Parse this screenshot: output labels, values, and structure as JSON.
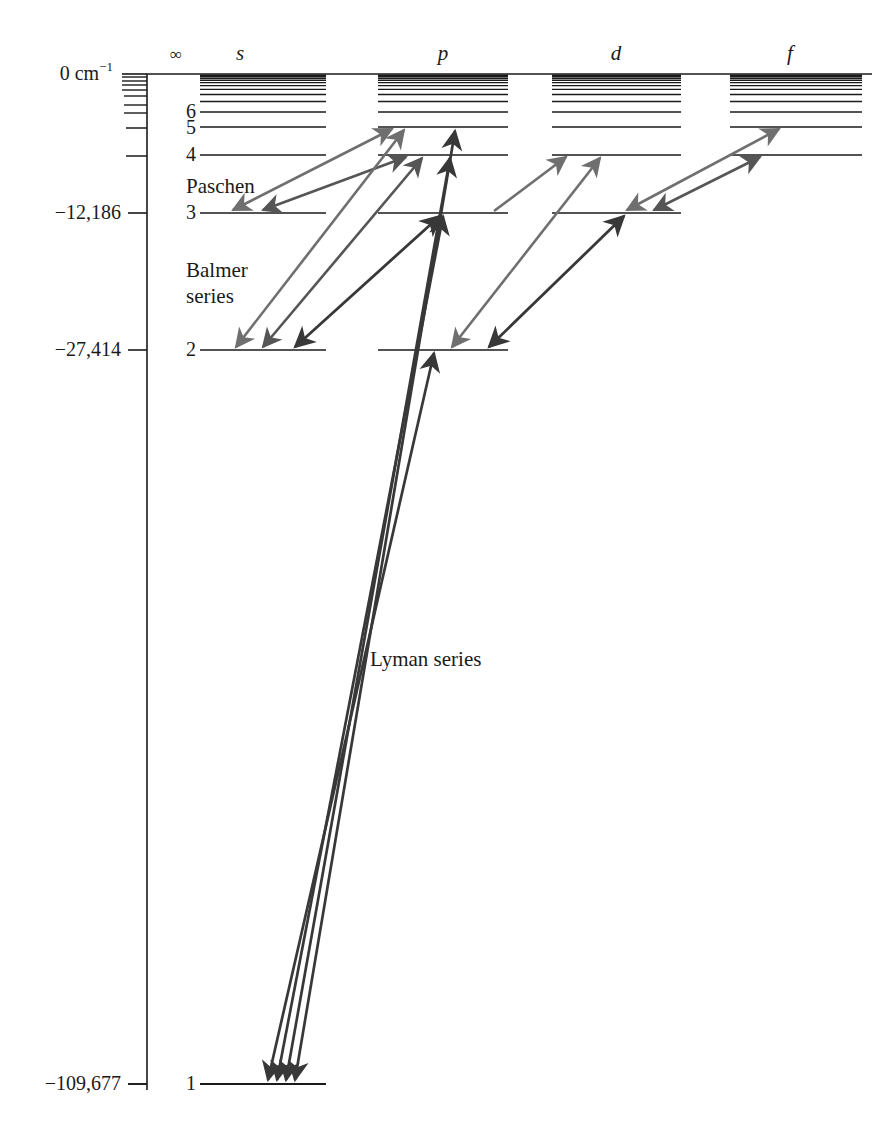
{
  "figure": {
    "kind": "grotrian-energy-level-diagram",
    "background_color": "#ffffff",
    "ink_color": "#1a1a1a"
  },
  "axis": {
    "unit_label_top": "0 cm",
    "unit_label_top_sup": "−1",
    "ticks": [
      {
        "label": "0 cm−1",
        "value": 0,
        "y": 74
      },
      {
        "label": "",
        "value": -12186,
        "y": 213
      },
      {
        "label": "−12,186",
        "value": -12186,
        "y": 213
      },
      {
        "label": "−27,414",
        "value": -27414,
        "y": 350
      },
      {
        "label": "−109,677",
        "value": -109677,
        "y": 1084
      }
    ],
    "labeled_ticks": [
      {
        "text": "0 cm",
        "sup": "−1",
        "y": 74
      },
      {
        "text": "−12,186",
        "sup": "",
        "y": 213
      },
      {
        "text": "−27,414",
        "sup": "",
        "y": 350
      },
      {
        "text": "−109,677",
        "sup": "",
        "y": 1084
      }
    ],
    "minor_tick_ys": [
      77,
      82,
      87,
      92,
      98,
      106,
      113,
      127,
      155
    ]
  },
  "columns": [
    {
      "name": "infinity",
      "label": "∞",
      "header_x": 176,
      "x1": 0,
      "x2": 0,
      "italic": false
    },
    {
      "name": "s",
      "label": "s",
      "header_x": 240,
      "x1": 200,
      "x2": 326,
      "italic": true
    },
    {
      "name": "p",
      "label": "p",
      "header_x": 443,
      "x1": 378,
      "x2": 508,
      "italic": true
    },
    {
      "name": "d",
      "label": "d",
      "header_x": 616,
      "x1": 552,
      "x2": 681,
      "italic": true
    },
    {
      "name": "f",
      "label": "f",
      "header_x": 790,
      "x1": 730,
      "x2": 862,
      "italic": true
    }
  ],
  "levels": {
    "numbered": [
      {
        "n": 1,
        "y": 1084,
        "label": "1",
        "columns": [
          "s"
        ]
      },
      {
        "n": 2,
        "y": 350,
        "label": "2",
        "columns": [
          "s",
          "p"
        ]
      },
      {
        "n": 3,
        "y": 213,
        "label": "3",
        "columns": [
          "s",
          "p",
          "d"
        ]
      },
      {
        "n": 4,
        "y": 155,
        "label": "4",
        "columns": [
          "s",
          "p",
          "d",
          "f"
        ]
      },
      {
        "n": 5,
        "y": 127,
        "label": "5",
        "columns": [
          "s",
          "p",
          "d",
          "f"
        ]
      },
      {
        "n": 6,
        "y": 112,
        "label": "6",
        "columns": [
          "s",
          "p",
          "d",
          "f"
        ]
      }
    ],
    "unlabeled_ys": [
      103,
      97,
      92,
      88,
      85,
      82,
      80,
      78,
      76.5,
      75.5,
      74.8
    ],
    "number_label_x": 193
  },
  "series_labels": [
    {
      "key": "paschen",
      "text": "Paschen",
      "x": 186,
      "y": 186
    },
    {
      "key": "balmer_line1",
      "text": "Balmer",
      "x": 186,
      "y": 270
    },
    {
      "key": "balmer_line2",
      "text": "series",
      "x": 186,
      "y": 296
    },
    {
      "key": "lyman",
      "text": "Lyman series",
      "x": 370,
      "y": 660
    }
  ],
  "arrow_colors": {
    "light": "#6f6f6f",
    "mid": "#555555",
    "dark": "#383838"
  },
  "transitions": [
    {
      "series": "Paschen",
      "from_col": "p",
      "from_n": 5,
      "to_col": "s",
      "to_n": 3,
      "tone": "light",
      "double": true
    },
    {
      "series": "Paschen",
      "from_col": "p",
      "from_n": 4,
      "to_col": "s",
      "to_n": 3,
      "tone": "mid",
      "double": true
    },
    {
      "series": "Paschen",
      "from_col": "f",
      "from_n": 5,
      "to_col": "d",
      "to_n": 3,
      "tone": "light",
      "double": true
    },
    {
      "series": "Paschen",
      "from_col": "f",
      "from_n": 4,
      "to_col": "d",
      "to_n": 3,
      "tone": "mid",
      "double": true
    },
    {
      "series": "Paschen",
      "from_col": "d",
      "from_n": 4,
      "to_col": "p",
      "to_n": 3,
      "tone": "light",
      "double": false
    },
    {
      "series": "Balmer",
      "from_col": "p",
      "from_n": 5,
      "to_col": "s",
      "to_n": 2,
      "tone": "light",
      "double": true
    },
    {
      "series": "Balmer",
      "from_col": "p",
      "from_n": 4,
      "to_col": "s",
      "to_n": 2,
      "tone": "mid",
      "double": true
    },
    {
      "series": "Balmer",
      "from_col": "p",
      "from_n": 3,
      "to_col": "s",
      "to_n": 2,
      "tone": "dark",
      "double": true
    },
    {
      "series": "Balmer",
      "from_col": "d",
      "from_n": 4,
      "to_col": "p",
      "to_n": 2,
      "tone": "light",
      "double": true
    },
    {
      "series": "Balmer",
      "from_col": "d",
      "from_n": 3,
      "to_col": "p",
      "to_n": 2,
      "tone": "dark",
      "double": true
    },
    {
      "series": "Lyman",
      "from_col": "p",
      "from_n": 5,
      "to_col": "s",
      "to_n": 1,
      "tone": "dark",
      "double": true
    },
    {
      "series": "Lyman",
      "from_col": "p",
      "from_n": 4,
      "to_col": "s",
      "to_n": 1,
      "tone": "dark",
      "double": true
    },
    {
      "series": "Lyman",
      "from_col": "p",
      "from_n": 3,
      "to_col": "s",
      "to_n": 1,
      "tone": "dark",
      "double": true
    },
    {
      "series": "Lyman",
      "from_col": "p",
      "from_n": 2,
      "to_col": "s",
      "to_n": 1,
      "tone": "dark",
      "double": true
    }
  ],
  "geometry": {
    "axis_x": 147,
    "axis_top_y": 74,
    "axis_bottom_y": 1084,
    "tick_left_x": 120,
    "label_right_x": 113
  }
}
